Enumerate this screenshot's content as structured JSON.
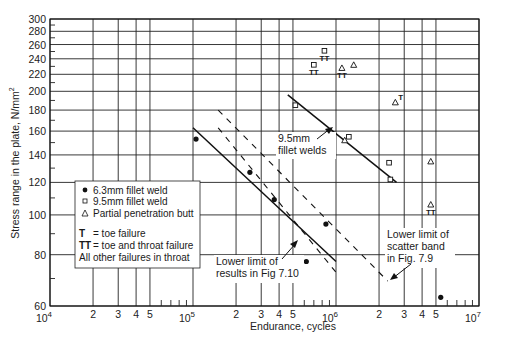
{
  "chart_data": {
    "type": "scatter",
    "title": "",
    "xlabel": "Endurance, cycles",
    "ylabel": "Stress range in the plate, N/mm",
    "ylabel_superscript": "2",
    "xscale": "log",
    "yscale": "log",
    "xlim": [
      10000,
      10000000
    ],
    "ylim": [
      60,
      300
    ],
    "grid": true,
    "x_major_ticks": [
      {
        "value": 10000,
        "base": "10",
        "exp": "4"
      },
      {
        "value": 100000,
        "base": "10",
        "exp": "5"
      },
      {
        "value": 1000000,
        "base": "10",
        "exp": "6"
      },
      {
        "value": 10000000,
        "base": "10",
        "exp": "7"
      }
    ],
    "x_minor_labels": [
      "2",
      "3",
      "4",
      "5"
    ],
    "y_tick_labels": [
      "60",
      "80",
      "100",
      "120",
      "140",
      "160",
      "180",
      "200",
      "220",
      "240",
      "260",
      "280",
      "300"
    ],
    "y_ticks": [
      60,
      80,
      100,
      120,
      140,
      160,
      180,
      200,
      220,
      240,
      260,
      280,
      300
    ],
    "series": [
      {
        "name": "6.3mm fillet weld",
        "marker": "filled-circle",
        "points": [
          {
            "x": 105000,
            "y": 153
          },
          {
            "x": 250000,
            "y": 127
          },
          {
            "x": 370000,
            "y": 109
          },
          {
            "x": 620000,
            "y": 77
          },
          {
            "x": 850000,
            "y": 95
          },
          {
            "x": 5400000,
            "y": 63
          }
        ]
      },
      {
        "name": "9.5mm fillet weld",
        "marker": "open-square",
        "points": [
          {
            "x": 520000,
            "y": 185,
            "failure": ""
          },
          {
            "x": 700000,
            "y": 232,
            "failure": "TT"
          },
          {
            "x": 830000,
            "y": 251,
            "failure": "TT"
          },
          {
            "x": 1230000,
            "y": 155,
            "failure": ""
          },
          {
            "x": 2350000,
            "y": 134,
            "failure": ""
          },
          {
            "x": 2400000,
            "y": 122,
            "failure": ""
          }
        ]
      },
      {
        "name": "Partial penetration butt",
        "marker": "open-triangle",
        "points": [
          {
            "x": 1100000,
            "y": 228,
            "failure": "TT"
          },
          {
            "x": 1330000,
            "y": 232,
            "failure": ""
          },
          {
            "x": 1150000,
            "y": 152,
            "failure": ""
          },
          {
            "x": 2600000,
            "y": 188,
            "failure": "T"
          },
          {
            "x": 4600000,
            "y": 135,
            "failure": ""
          },
          {
            "x": 4600000,
            "y": 106,
            "failure": "TT"
          }
        ]
      }
    ],
    "lines": [
      {
        "name": "9.5mm fillet welds",
        "style": "solid",
        "from": {
          "x": 460000,
          "y": 196
        },
        "to": {
          "x": 2650000,
          "y": 120
        }
      },
      {
        "name": "6.3mm fillet line",
        "style": "solid",
        "from": {
          "x": 100000,
          "y": 163
        },
        "to": {
          "x": 1000000,
          "y": 77
        }
      },
      {
        "name": "Lower limit of results in Fig 7.10",
        "style": "dashed",
        "from": {
          "x": 150000,
          "y": 163
        },
        "to": {
          "x": 1050000,
          "y": 71
        }
      },
      {
        "name": "Lower limit of scatter band in Fig. 7.9",
        "style": "dashed",
        "from": {
          "x": 150000,
          "y": 180
        },
        "to": {
          "x": 2300000,
          "y": 69
        }
      }
    ],
    "annotations": [
      {
        "text": [
          "9.5mm",
          "fillet welds"
        ]
      },
      {
        "text": [
          "Lower limit of",
          "results in Fig 7.10"
        ]
      },
      {
        "text": [
          "Lower limit of",
          "scatter band",
          "in Fig. 7.9"
        ]
      }
    ],
    "legend": {
      "position": "lower-left",
      "entries": [
        {
          "symbol": "filled-circle",
          "label": "6.3mm fillet weld"
        },
        {
          "symbol": "open-square",
          "label": "9.5mm fillet weld"
        },
        {
          "symbol": "open-triangle",
          "label": "Partial penetration butt"
        }
      ],
      "notes": [
        {
          "key": "T",
          "label": "= toe failure"
        },
        {
          "key": "TT",
          "label": "= toe and throat failure"
        },
        {
          "key": "",
          "label": "All other failures in throat"
        }
      ]
    }
  }
}
